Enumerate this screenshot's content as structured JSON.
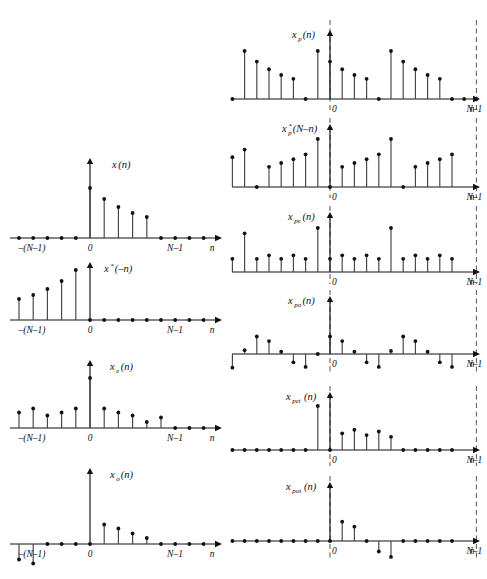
{
  "figure": {
    "title": "",
    "axis_label_n": "n",
    "tick_labels": {
      "neg_n_minus_1": "–(N–1)",
      "zero": "0",
      "n_minus_1": "N–1"
    }
  },
  "left_column": {
    "panels": [
      {
        "id": "x-n",
        "label_main": "x",
        "label_sub": "",
        "label_arg": "(n)",
        "ticks": [
          "–(N–1)",
          "0",
          "N–1",
          "n"
        ],
        "chart_data": {
          "type": "stem",
          "title": "x(n)",
          "xlabel": "n",
          "ylabel": "",
          "x": [
            -9,
            -8,
            -7,
            -6,
            -5,
            -4,
            -3,
            -2,
            -1,
            0,
            1,
            2,
            3,
            4,
            5,
            6,
            7,
            8
          ],
          "values": [
            0,
            0,
            0,
            0,
            0,
            0,
            0,
            0,
            0,
            1.0,
            0.78,
            0.62,
            0.5,
            0.42,
            0,
            0,
            0,
            0
          ],
          "ylim": [
            -1.0,
            1.15
          ]
        }
      },
      {
        "id": "x-conj-neg-n",
        "label_main": "x",
        "label_sub": "*",
        "label_arg": "(–n)",
        "ticks": [
          "–(N–1)",
          "0",
          "N–1",
          "n"
        ],
        "chart_data": {
          "type": "stem",
          "title": "x*(–n)",
          "xlabel": "n",
          "ylabel": "",
          "x": [
            -9,
            -8,
            -7,
            -6,
            -5,
            -4,
            -3,
            -2,
            -1,
            0,
            1,
            2,
            3,
            4,
            5,
            6,
            7,
            8
          ],
          "values": [
            0,
            0,
            0,
            0,
            0.42,
            0.5,
            0.62,
            0.78,
            1.0,
            0,
            0,
            0,
            0,
            0,
            0,
            0,
            0,
            0
          ],
          "ylim": [
            -1.0,
            1.15
          ]
        }
      },
      {
        "id": "x-e-n",
        "label_main": "x",
        "label_sub": "e",
        "label_arg": "(n)",
        "ticks": [
          "–(N–1)",
          "0",
          "N–1",
          "n"
        ],
        "chart_data": {
          "type": "stem",
          "title": "xₑ(n)",
          "xlabel": "n",
          "ylabel": "",
          "x": [
            -9,
            -8,
            -7,
            -6,
            -5,
            -4,
            -3,
            -2,
            -1,
            0,
            1,
            2,
            3,
            4,
            5,
            6,
            7,
            8
          ],
          "values": [
            0,
            0,
            0.12,
            0.21,
            0.31,
            0.39,
            0.25,
            0.31,
            0.39,
            1.0,
            0.39,
            0.31,
            0.25,
            0.12,
            0.21,
            0,
            0,
            0
          ],
          "ylim": [
            -1.0,
            1.15
          ]
        }
      },
      {
        "id": "x-o-n",
        "label_main": "x",
        "label_sub": "o",
        "label_arg": "(n)",
        "ticks": [
          "–(N–1)",
          "0",
          "N–1",
          "n"
        ],
        "chart_data": {
          "type": "stem",
          "title": "xₒ(n)",
          "xlabel": "n",
          "ylabel": "",
          "x": [
            -9,
            -8,
            -7,
            -6,
            -5,
            -4,
            -3,
            -2,
            -1,
            0,
            1,
            2,
            3,
            4,
            5,
            6,
            7,
            8
          ],
          "values": [
            0,
            0,
            -0.1,
            -0.21,
            -0.31,
            -0.39,
            0,
            0,
            0,
            0,
            0.39,
            0.31,
            0.21,
            0.12,
            0,
            0,
            0,
            0
          ],
          "ylim": [
            -0.72,
            1.15
          ]
        }
      }
    ]
  },
  "right_column": {
    "panels": [
      {
        "id": "xp-n",
        "label_main": "x",
        "label_sub": "p",
        "label_arg": "(n)",
        "ticks": [
          "0",
          "N–1",
          "n"
        ],
        "chart_data": {
          "type": "stem",
          "title": "xₚ(n)",
          "xlabel": "n",
          "ylabel": "",
          "x": [
            -9,
            -8,
            -7,
            -6,
            -5,
            -4,
            -3,
            -2,
            -1,
            0,
            1,
            2,
            3,
            4,
            5,
            6,
            7,
            8,
            9,
            10,
            11,
            12,
            13,
            14
          ],
          "values": [
            0,
            1.0,
            0.78,
            0.62,
            0.5,
            0.42,
            0,
            1.0,
            0.78,
            0.62,
            0.5,
            0.42,
            0,
            1.0,
            0.78,
            0.62,
            0.5,
            0.42,
            0,
            0,
            0,
            0,
            0,
            0
          ],
          "ylim": [
            -0.1,
            1.15
          ]
        }
      },
      {
        "id": "xp-conj-N-minus-n",
        "label_main": "x",
        "label_sub": "p",
        "label_star": "*",
        "label_arg": "(N–n)",
        "ticks": [
          "0",
          "N–1",
          "n"
        ],
        "chart_data": {
          "type": "stem",
          "title": "x*ₚ(N–n)",
          "xlabel": "n",
          "ylabel": "",
          "values": [
            0.62,
            0.78,
            0,
            0.42,
            0.5,
            0.58,
            0.68,
            1.0,
            0,
            0.42,
            0.5,
            0.58,
            0.68,
            1.0,
            0,
            0.42,
            0.5,
            0.58,
            0.68
          ],
          "ylim": [
            -0.1,
            1.15
          ]
        }
      },
      {
        "id": "xpe-n",
        "label_main": "x",
        "label_sub": "pe",
        "label_arg": "(n)",
        "ticks": [
          "0",
          "N–1",
          "n"
        ],
        "chart_data": {
          "type": "stem",
          "title": "xₚₑ(n)",
          "xlabel": "n",
          "ylabel": "",
          "values": [
            0.3,
            0.88,
            0.3,
            0.38,
            0.3,
            0.38,
            0.3,
            1.0,
            0.3,
            0.38,
            0.3,
            0.38,
            0.3,
            1.0,
            0.3,
            0.38,
            0.3,
            0.38,
            0.3
          ],
          "ylim": [
            -0.1,
            1.15
          ]
        }
      },
      {
        "id": "xpo-n",
        "label_main": "x",
        "label_sub": "po",
        "label_arg": "(n)",
        "ticks": [
          "0",
          "N–1",
          "n"
        ],
        "chart_data": {
          "type": "stem",
          "title": "xₚₒ(n)",
          "xlabel": "n",
          "ylabel": "",
          "values": [
            -0.36,
            0.1,
            0.46,
            0.34,
            0.06,
            -0.22,
            -0.34,
            0,
            0.46,
            0.34,
            0.06,
            -0.22,
            -0.34,
            0.08,
            0.46,
            0.34,
            0.06,
            -0.22,
            -0.34
          ],
          "ylim": [
            -0.55,
            1.15
          ]
        }
      },
      {
        "id": "xpet-n",
        "label_main": "x",
        "label_sub": "pet",
        "label_arg": "(n)",
        "ticks": [
          "0",
          "N–1",
          "n"
        ],
        "chart_data": {
          "type": "stem",
          "title": "xₚₑₜ(n)",
          "xlabel": "n",
          "ylabel": "",
          "values": [
            0,
            0,
            0,
            0,
            0,
            0,
            0,
            1.0,
            0,
            0.38,
            0.46,
            0.34,
            0.42,
            0.3,
            0,
            0,
            0,
            0,
            0
          ],
          "ylim": [
            -0.2,
            1.15
          ]
        }
      },
      {
        "id": "xpot-n",
        "label_main": "x",
        "label_sub": "pot",
        "label_arg": "(n)",
        "ticks": [
          "0",
          "N–1",
          "n"
        ],
        "chart_data": {
          "type": "stem",
          "title": "xₚₒₜ(n)",
          "xlabel": "n",
          "ylabel": "",
          "values": [
            0,
            0,
            0,
            0,
            0,
            0,
            0,
            0,
            0,
            0.46,
            0.34,
            0,
            -0.25,
            -0.38,
            0,
            0,
            0,
            0,
            0
          ],
          "ylim": [
            -0.55,
            1.15
          ]
        }
      }
    ]
  }
}
